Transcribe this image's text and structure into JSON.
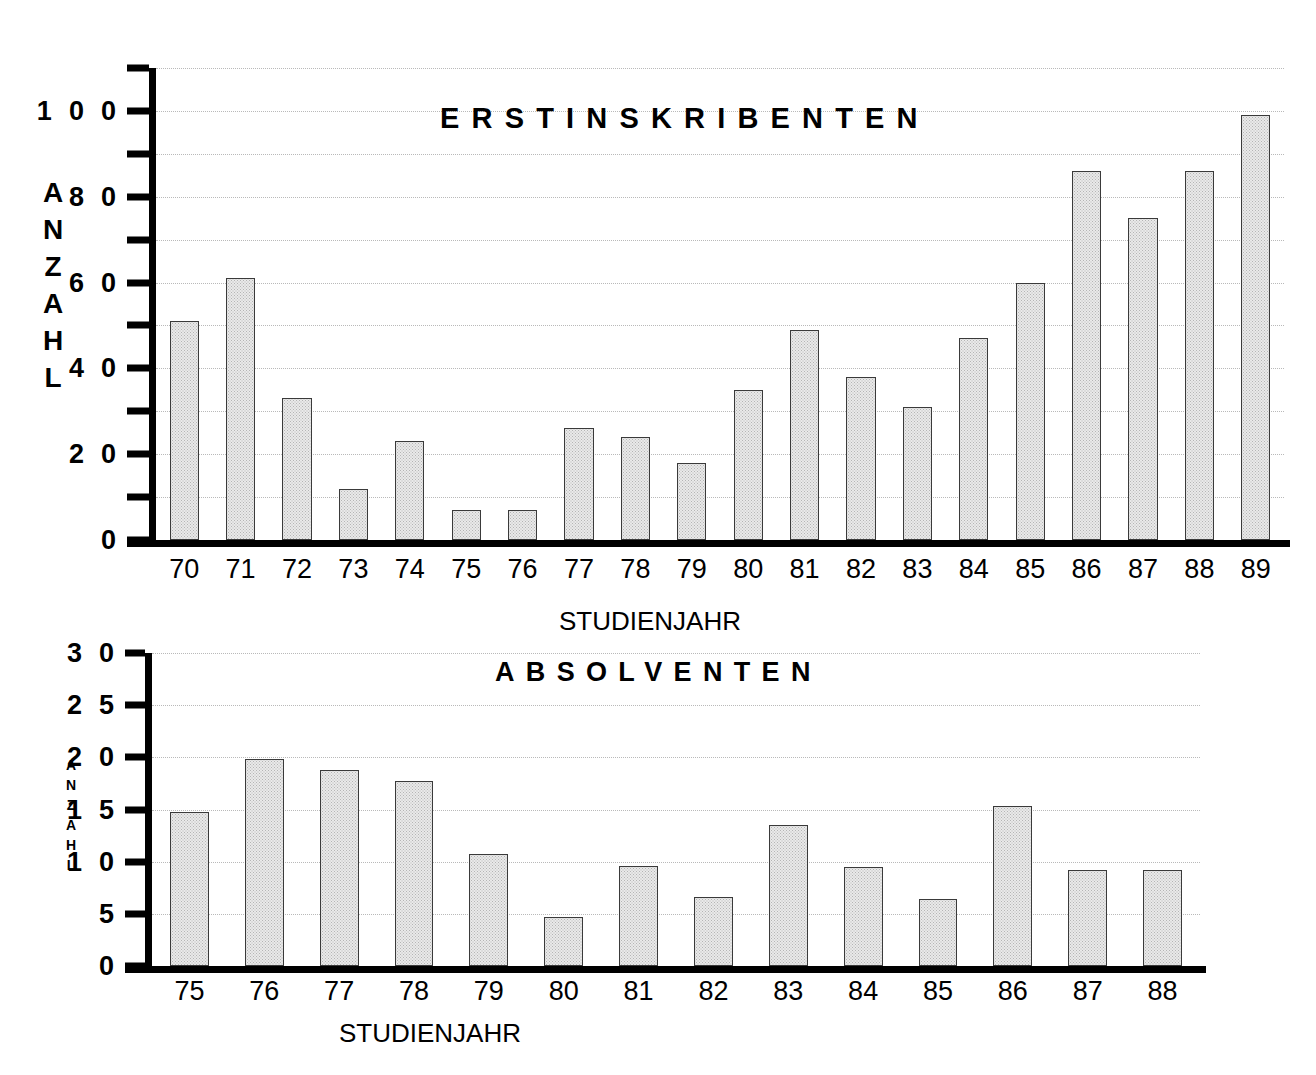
{
  "chart_data": [
    {
      "type": "bar",
      "title": "ERSTINSKRIBENTEN",
      "xlabel": "STUDIENJAHR",
      "ylabel": "ANZAHL",
      "ylabel_letters": [
        "A",
        "N",
        "Z",
        "A",
        "H",
        "L"
      ],
      "categories": [
        "70",
        "71",
        "72",
        "73",
        "74",
        "75",
        "76",
        "77",
        "78",
        "79",
        "80",
        "81",
        "82",
        "83",
        "84",
        "85",
        "86",
        "87",
        "88",
        "89"
      ],
      "values": [
        51,
        61,
        33,
        12,
        23,
        7,
        7,
        26,
        24,
        18,
        35,
        49,
        38,
        31,
        47,
        60,
        86,
        75,
        86,
        99
      ],
      "ylim": [
        0,
        110
      ],
      "ytick_values": [
        0,
        10,
        20,
        30,
        40,
        50,
        60,
        70,
        80,
        90,
        100,
        110
      ],
      "ytick_labels": [
        "0",
        "",
        "2 0",
        "",
        "4 0",
        "",
        "6 0",
        "",
        "8 0",
        "",
        "1 0 0",
        ""
      ],
      "grid": true,
      "legend": "none"
    },
    {
      "type": "bar",
      "title": "ABSOLVENTEN",
      "xlabel": "STUDIENJAHR",
      "ylabel": "ANZAHL",
      "ylabel_letters": [
        "A",
        "N",
        "Z",
        "A",
        "H",
        "L"
      ],
      "categories": [
        "75",
        "76",
        "77",
        "78",
        "79",
        "80",
        "81",
        "82",
        "83",
        "84",
        "85",
        "86",
        "87",
        "88"
      ],
      "values": [
        14.8,
        19.8,
        18.8,
        17.7,
        10.7,
        4.7,
        9.6,
        6.6,
        13.5,
        9.5,
        6.4,
        15.3,
        9.2,
        9.2
      ],
      "ylim": [
        0,
        30
      ],
      "ytick_values": [
        0,
        5,
        10,
        15,
        20,
        25,
        30
      ],
      "ytick_labels": [
        "0",
        "5",
        "1 0",
        "1 5",
        "2 0",
        "2 5",
        "3 0"
      ],
      "grid": true,
      "legend": "none"
    }
  ],
  "style": {
    "bar_fill": "#e9e9e9",
    "bar_edge": "#3a3a3a",
    "grid_color": "#b9b9b9",
    "axis_color": "#000000",
    "background": "#ffffff"
  }
}
